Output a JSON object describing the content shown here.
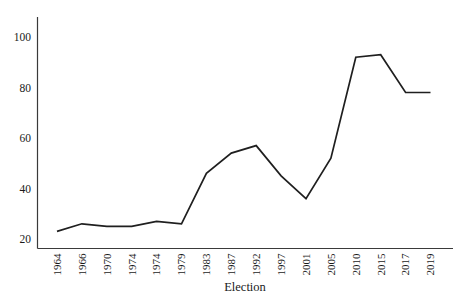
{
  "chart_data": {
    "type": "line",
    "title": "",
    "xlabel": "Election",
    "ylabel": "",
    "categories": [
      "1964",
      "1966",
      "1970",
      "1974",
      "1974",
      "1979",
      "1983",
      "1987",
      "1992",
      "1997",
      "2001",
      "2005",
      "2010",
      "2015",
      "2017",
      "2019"
    ],
    "values": [
      23,
      26,
      25,
      25,
      27,
      26,
      46,
      54,
      57,
      45,
      36,
      52,
      92,
      93,
      78,
      78
    ],
    "yticks": [
      20,
      40,
      60,
      80,
      100
    ],
    "ylim": [
      15,
      108
    ],
    "grid": false,
    "legend": false,
    "colors": {
      "line": "#1f1f1f",
      "axis": "#3a3a3a",
      "text": "#1a1a1a",
      "background": "#ffffff"
    }
  }
}
